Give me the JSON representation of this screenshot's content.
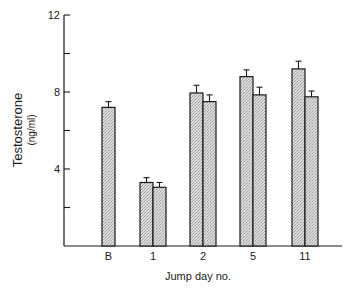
{
  "chart_data": {
    "type": "bar",
    "title": "",
    "xlabel": "Jump day no.",
    "ylabel": "Testosterone",
    "ylabel_unit": "(ng/ml)",
    "ylim": [
      0,
      12
    ],
    "yticks": [
      0,
      2,
      4,
      6,
      8,
      10,
      12
    ],
    "ytick_labels": [
      "",
      "",
      "4",
      "",
      "8",
      "",
      "12"
    ],
    "grid": false,
    "legend": null,
    "categories": [
      "B",
      "1",
      "2",
      "5",
      "11"
    ],
    "series": [
      {
        "name": "series-1",
        "values": [
          7.2,
          3.3,
          7.95,
          8.8,
          9.2
        ],
        "errors": [
          0.3,
          0.25,
          0.4,
          0.35,
          0.4
        ]
      },
      {
        "name": "series-2",
        "values": [
          null,
          3.05,
          7.5,
          7.85,
          7.75
        ],
        "errors": [
          null,
          0.25,
          0.35,
          0.4,
          0.3
        ]
      }
    ],
    "bar_fill": "#d4d4d4",
    "bar_stroke": "#1a1a1a"
  }
}
